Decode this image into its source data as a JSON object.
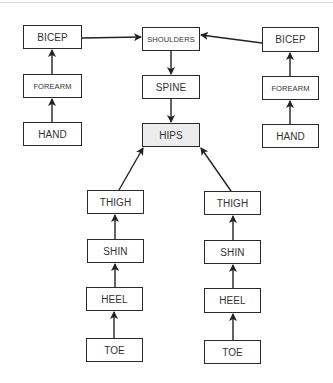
{
  "diagram": {
    "type": "skeleton-hierarchy",
    "highlight_color": "#ececec",
    "line_color": "#222222",
    "nodes": [
      {
        "id": "bicep_l",
        "label": "BICEP",
        "x": 23,
        "y": 25,
        "w": 59,
        "h": 24
      },
      {
        "id": "forearm_l",
        "label": "FOREARM",
        "x": 23,
        "y": 74,
        "w": 59,
        "h": 24
      },
      {
        "id": "hand_l",
        "label": "HAND",
        "x": 23,
        "y": 122,
        "w": 59,
        "h": 24
      },
      {
        "id": "shoulders",
        "label": "SHOULDERS",
        "x": 142,
        "y": 27,
        "w": 58,
        "h": 24
      },
      {
        "id": "spine",
        "label": "SPINE",
        "x": 142,
        "y": 75,
        "w": 58,
        "h": 24
      },
      {
        "id": "hips",
        "label": "HIPS",
        "x": 142,
        "y": 123,
        "w": 58,
        "h": 24,
        "highlighted": true
      },
      {
        "id": "bicep_r",
        "label": "BICEP",
        "x": 262,
        "y": 27,
        "w": 57,
        "h": 25
      },
      {
        "id": "forearm_r",
        "label": "FOREARM",
        "x": 262,
        "y": 76,
        "w": 57,
        "h": 24
      },
      {
        "id": "hand_r",
        "label": "HAND",
        "x": 262,
        "y": 124,
        "w": 57,
        "h": 24
      },
      {
        "id": "thigh_l",
        "label": "THIGH",
        "x": 87,
        "y": 190,
        "w": 57,
        "h": 24
      },
      {
        "id": "shin_l",
        "label": "SHIN",
        "x": 87,
        "y": 239,
        "w": 57,
        "h": 24
      },
      {
        "id": "heel_l",
        "label": "HEEL",
        "x": 86,
        "y": 287,
        "w": 57,
        "h": 24
      },
      {
        "id": "toe_l",
        "label": "TOE",
        "x": 86,
        "y": 338,
        "w": 57,
        "h": 24
      },
      {
        "id": "thigh_r",
        "label": "THIGH",
        "x": 204,
        "y": 191,
        "w": 57,
        "h": 24
      },
      {
        "id": "shin_r",
        "label": "SHIN",
        "x": 204,
        "y": 240,
        "w": 57,
        "h": 24
      },
      {
        "id": "heel_r",
        "label": "HEEL",
        "x": 204,
        "y": 288,
        "w": 57,
        "h": 25
      },
      {
        "id": "toe_r",
        "label": "TOE",
        "x": 204,
        "y": 340,
        "w": 57,
        "h": 24
      }
    ],
    "edges": [
      {
        "from": "hand_l",
        "to": "forearm_l"
      },
      {
        "from": "forearm_l",
        "to": "bicep_l"
      },
      {
        "from": "bicep_l",
        "to": "shoulders"
      },
      {
        "from": "hand_r",
        "to": "forearm_r"
      },
      {
        "from": "forearm_r",
        "to": "bicep_r"
      },
      {
        "from": "bicep_r",
        "to": "shoulders"
      },
      {
        "from": "shoulders",
        "to": "spine"
      },
      {
        "from": "spine",
        "to": "hips"
      },
      {
        "from": "toe_l",
        "to": "heel_l"
      },
      {
        "from": "heel_l",
        "to": "shin_l"
      },
      {
        "from": "shin_l",
        "to": "thigh_l"
      },
      {
        "from": "thigh_l",
        "to": "hips"
      },
      {
        "from": "toe_r",
        "to": "heel_r"
      },
      {
        "from": "heel_r",
        "to": "shin_r"
      },
      {
        "from": "shin_r",
        "to": "thigh_r"
      },
      {
        "from": "thigh_r",
        "to": "hips"
      }
    ]
  },
  "labels": {
    "bicep_l": "BICEP",
    "forearm_l": "FOREARM",
    "hand_l": "HAND",
    "shoulders": "SHOULDERS",
    "spine": "SPINE",
    "hips": "HIPS",
    "bicep_r": "BICEP",
    "forearm_r": "FOREARM",
    "hand_r": "HAND",
    "thigh_l": "THIGH",
    "shin_l": "SHIN",
    "heel_l": "HEEL",
    "toe_l": "TOE",
    "thigh_r": "THIGH",
    "shin_r": "SHIN",
    "heel_r": "HEEL",
    "toe_r": "TOE"
  }
}
